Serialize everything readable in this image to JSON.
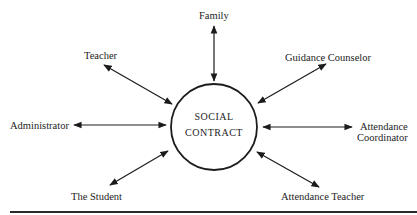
{
  "center": {
    "line1": "SOCIAL",
    "line2": "CONTRACT",
    "cx": 214,
    "cy": 127,
    "r": 43
  },
  "nodes": [
    {
      "id": "family",
      "label": "Family"
    },
    {
      "id": "teacher",
      "label": "Teacher"
    },
    {
      "id": "guidance-counselor",
      "label": "Guidance Counselor"
    },
    {
      "id": "administrator",
      "label": "Administrator"
    },
    {
      "id": "attendance-coordinator",
      "label_line1": "Attendance",
      "label_line2": "Coordinator"
    },
    {
      "id": "the-student",
      "label": "The Student"
    },
    {
      "id": "attendance-teacher",
      "label": "Attendance Teacher"
    }
  ],
  "colors": {
    "stroke": "#1c1c1c",
    "background": "#ffffff"
  }
}
